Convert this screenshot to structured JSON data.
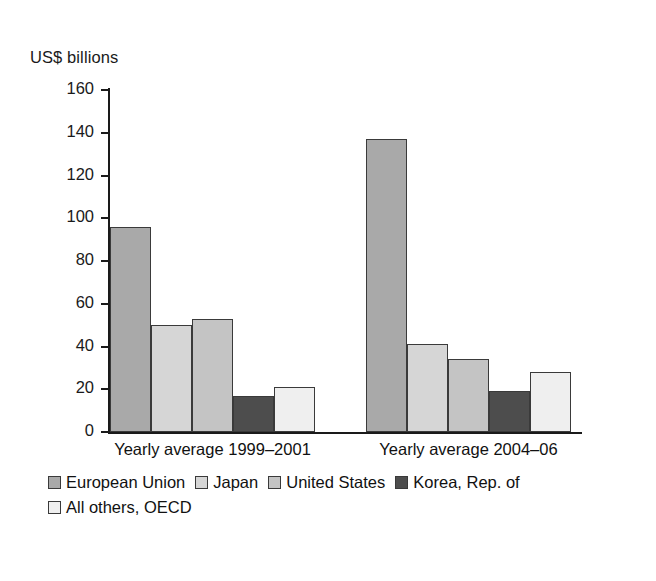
{
  "chart_data": {
    "type": "bar",
    "title": "",
    "subtitle": "",
    "xlabel": "",
    "ylabel": "US$ billions",
    "ylim": [
      0,
      160
    ],
    "yticks": [
      0,
      20,
      40,
      60,
      80,
      100,
      120,
      140,
      160
    ],
    "ytick_labels": [
      "0",
      "20",
      "40",
      "60",
      "80",
      "100",
      "120",
      "140",
      "160"
    ],
    "grid": false,
    "legend_position": "bottom-left",
    "categories": [
      "Yearly average 1999–2001",
      "Yearly average 2004–06"
    ],
    "series": [
      {
        "name": "European Union",
        "color": "#a9a9a9",
        "values": [
          96,
          137
        ]
      },
      {
        "name": "Japan",
        "color": "#d6d6d6",
        "values": [
          50,
          41
        ]
      },
      {
        "name": "United States",
        "color": "#c4c4c4",
        "values": [
          53,
          34
        ]
      },
      {
        "name": "Korea, Rep. of",
        "color": "#4d4d4d",
        "values": [
          17,
          19
        ]
      },
      {
        "name": "All others, OECD",
        "color": "#efefef",
        "values": [
          21,
          28
        ]
      }
    ]
  },
  "axis": {
    "y_title": "US$ billions"
  },
  "legend": {
    "rows": [
      [
        "European Union",
        "Japan",
        "United States",
        "Korea, Rep. of"
      ],
      [
        "All others, OECD"
      ]
    ]
  },
  "colors": {
    "european_union": "#a9a9a9",
    "japan": "#d6d6d6",
    "united_states": "#c4c4c4",
    "korea": "#4d4d4d",
    "all_others_oecd": "#efefef",
    "axis": "#1a1a1a",
    "bar_border": "#3a3a3a",
    "background": "#ffffff"
  }
}
